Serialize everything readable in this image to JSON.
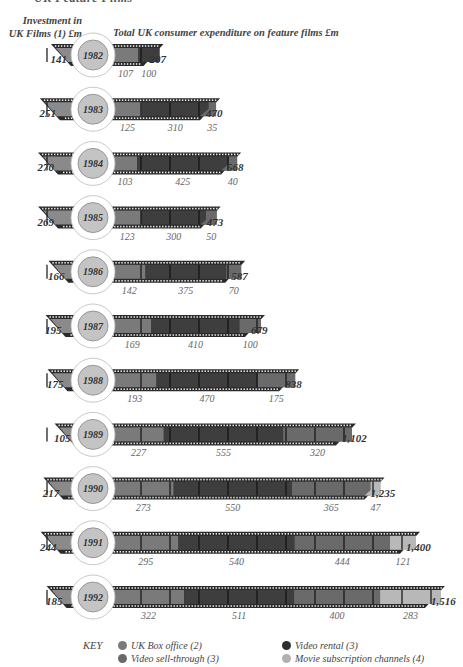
{
  "header": {
    "cut_title": "UK Feature Films",
    "left_label_line1": "Investment in",
    "left_label_line2": "UK Films (1) £m",
    "right_label": "Total UK consumer expenditure on feature films £m"
  },
  "colors": {
    "box_office": "#7a7a7a",
    "video_rental": "#3e3e3e",
    "video_sell_through": "#6a6a6a",
    "movie_subscription": "#b8b8b8",
    "investment": "#8a8a8a",
    "film_edge": "#2a2a2a",
    "year_disk": "#c4c4c4"
  },
  "key": {
    "title": "KEY",
    "items": [
      {
        "label": "UK Box office (2)",
        "color": "#7a7a7a"
      },
      {
        "label": "Video rental (3)",
        "color": "#2e2e2e"
      },
      {
        "label": "Video sell-through (3)",
        "color": "#6a6a6a"
      },
      {
        "label": "Movie subscription channels (4)",
        "color": "#b0b0b0"
      }
    ]
  },
  "chart_data": {
    "type": "bar",
    "title": "Total UK consumer expenditure on feature films £m",
    "subtitle": "Investment in UK Films (1) £m",
    "categories": [
      "1982",
      "1983",
      "1984",
      "1985",
      "1986",
      "1987",
      "1988",
      "1989",
      "1990",
      "1991",
      "1992"
    ],
    "series": [
      {
        "name": "Investment in UK Films (1) £m",
        "values": [
          141,
          251,
          270,
          269,
          166,
          195,
          175,
          105,
          217,
          244,
          185
        ]
      },
      {
        "name": "UK Box office (2)",
        "values": [
          107,
          125,
          103,
          123,
          142,
          169,
          193,
          227,
          273,
          295,
          322
        ]
      },
      {
        "name": "Video rental (3)",
        "values": [
          100,
          310,
          425,
          300,
          375,
          410,
          470,
          555,
          550,
          540,
          511
        ]
      },
      {
        "name": "Video sell-through (3)",
        "values": [
          null,
          35,
          40,
          50,
          70,
          100,
          175,
          320,
          365,
          444,
          400
        ]
      },
      {
        "name": "Movie subscription channels (4)",
        "values": [
          null,
          null,
          null,
          null,
          null,
          null,
          null,
          null,
          47,
          121,
          283
        ]
      },
      {
        "name": "Total UK consumer expenditure £m",
        "values": [
          207,
          470,
          568,
          473,
          587,
          679,
          838,
          1102,
          1235,
          1400,
          1516
        ]
      }
    ],
    "labels": {
      "investment": [
        "141",
        "251",
        "270",
        "269",
        "166",
        "195",
        "175",
        "105",
        "217",
        "244",
        "185"
      ],
      "total": [
        "207",
        "470",
        "568",
        "473",
        "587",
        "679",
        "838",
        "1,102",
        "1,235",
        "1,400",
        "1,516"
      ],
      "segments": [
        [
          "107",
          "100"
        ],
        [
          "125",
          "310",
          "35"
        ],
        [
          "103",
          "425",
          "40"
        ],
        [
          "123",
          "300",
          "50"
        ],
        [
          "142",
          "375",
          "70"
        ],
        [
          "169",
          "410",
          "100"
        ],
        [
          "193",
          "470",
          "175"
        ],
        [
          "227",
          "555",
          "320"
        ],
        [
          "273",
          "550",
          "365",
          "47"
        ],
        [
          "295",
          "540",
          "444",
          "121"
        ],
        [
          "322",
          "511",
          "400",
          "283"
        ]
      ]
    },
    "xlabel": "",
    "ylabel": "",
    "legend_position": "bottom",
    "grid": false
  }
}
